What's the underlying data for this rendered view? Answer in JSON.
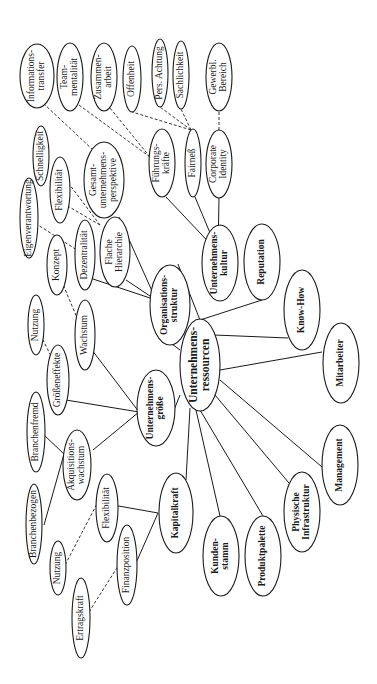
{
  "diagram": {
    "orientation": "rotated-90-ccw",
    "root": "Unternehmensressourcen",
    "nodes": [
      {
        "id": "ressourcen",
        "lines": [
          "Unternehmens-",
          "ressourcen"
        ],
        "x": 200,
        "y": 365,
        "rx": 20,
        "ry": 46,
        "style": "core"
      },
      {
        "id": "orgstruktur",
        "lines": [
          "Organisations-",
          "struktur"
        ],
        "x": 170,
        "y": 305,
        "rx": 20,
        "ry": 40,
        "style": "bold"
      },
      {
        "id": "groesse",
        "lines": [
          "Unternehmens-",
          "größe"
        ],
        "x": 156,
        "y": 408,
        "rx": 19,
        "ry": 38,
        "style": "bold"
      },
      {
        "id": "kapitalkraft",
        "lines": [
          "Kapitalkraft"
        ],
        "x": 176,
        "y": 513,
        "rx": 17,
        "ry": 40,
        "style": "bold"
      },
      {
        "id": "kultur",
        "lines": [
          "Unternehmens-",
          "kultur"
        ],
        "x": 220,
        "y": 263,
        "rx": 18,
        "ry": 38,
        "style": "bold"
      },
      {
        "id": "reputation",
        "lines": [
          "Reputation"
        ],
        "x": 262,
        "y": 262,
        "rx": 18,
        "ry": 38,
        "style": "bold"
      },
      {
        "id": "knowhow",
        "lines": [
          "Know-How"
        ],
        "x": 302,
        "y": 310,
        "rx": 18,
        "ry": 40,
        "style": "bold"
      },
      {
        "id": "mitarbeiter",
        "lines": [
          "Mitarbeiter"
        ],
        "x": 341,
        "y": 363,
        "rx": 18,
        "ry": 40,
        "style": "bold"
      },
      {
        "id": "management",
        "lines": [
          "Management"
        ],
        "x": 340,
        "y": 465,
        "rx": 18,
        "ry": 40,
        "style": "bold"
      },
      {
        "id": "infrastruktur",
        "lines": [
          "Physische",
          "Infrastruktur"
        ],
        "x": 302,
        "y": 512,
        "rx": 18,
        "ry": 40,
        "style": "bold"
      },
      {
        "id": "produktpalette",
        "lines": [
          "Produktpalette"
        ],
        "x": 263,
        "y": 556,
        "rx": 18,
        "ry": 40,
        "style": "bold"
      },
      {
        "id": "kundenstamm",
        "lines": [
          "Kunden-",
          "stamm"
        ],
        "x": 221,
        "y": 556,
        "rx": 18,
        "ry": 40,
        "style": "bold"
      },
      {
        "id": "fuehrungskraefte",
        "lines": [
          "Führungs-",
          "kräfte"
        ],
        "x": 162,
        "y": 163,
        "rx": 13,
        "ry": 34,
        "style": "normal"
      },
      {
        "id": "fairness",
        "lines": [
          "Fairneß"
        ],
        "x": 193,
        "y": 163,
        "rx": 8,
        "ry": 34,
        "style": "normal"
      },
      {
        "id": "corporate",
        "lines": [
          "Corporate",
          "Identity"
        ],
        "x": 219,
        "y": 164,
        "rx": 13,
        "ry": 34,
        "style": "normal"
      },
      {
        "id": "gewerbl",
        "lines": [
          "Gewerbl.",
          "Bereich"
        ],
        "x": 219,
        "y": 77,
        "rx": 13,
        "ry": 34,
        "style": "normal"
      },
      {
        "id": "informationstransfer",
        "lines": [
          "Informations-",
          "transfer"
        ],
        "x": 37,
        "y": 76,
        "rx": 17,
        "ry": 32,
        "style": "normal"
      },
      {
        "id": "teammentalitaet",
        "lines": [
          "Team-",
          "mentalität"
        ],
        "x": 70,
        "y": 77,
        "rx": 13,
        "ry": 34,
        "style": "normal"
      },
      {
        "id": "zusammenarbeit",
        "lines": [
          "Zusammen-",
          "arbeit"
        ],
        "x": 104,
        "y": 77,
        "rx": 13,
        "ry": 34,
        "style": "normal"
      },
      {
        "id": "offenheit",
        "lines": [
          "Offenheit"
        ],
        "x": 132,
        "y": 79,
        "rx": 9,
        "ry": 33,
        "style": "normal"
      },
      {
        "id": "persachtung",
        "lines": [
          "Pers. Achtung"
        ],
        "x": 160,
        "y": 73,
        "rx": 8,
        "ry": 34,
        "style": "normal"
      },
      {
        "id": "sachlichkeit",
        "lines": [
          "Sachlichkeit"
        ],
        "x": 181,
        "y": 75,
        "rx": 8,
        "ry": 34,
        "style": "normal"
      },
      {
        "id": "gesamtunternehmen",
        "lines": [
          "Gesamt-",
          "unternehmens-",
          "perspektive"
        ],
        "x": 104,
        "y": 180,
        "rx": 20,
        "ry": 38,
        "style": "normal"
      },
      {
        "id": "schnelligkeit",
        "lines": [
          "Schnelligkeit"
        ],
        "x": 41,
        "y": 156,
        "rx": 8,
        "ry": 30,
        "style": "normal"
      },
      {
        "id": "flexibilitaet_org",
        "lines": [
          "Flexibilität"
        ],
        "x": 60,
        "y": 190,
        "rx": 10,
        "ry": 33,
        "style": "normal"
      },
      {
        "id": "eigenverantwortung",
        "lines": [
          "Eigenverantwortung"
        ],
        "x": 29,
        "y": 218,
        "rx": 9,
        "ry": 40,
        "style": "normal"
      },
      {
        "id": "dezentralitaet",
        "lines": [
          "Dezentralität"
        ],
        "x": 85,
        "y": 255,
        "rx": 10,
        "ry": 35,
        "style": "normal"
      },
      {
        "id": "flachehierarchie",
        "lines": [
          "Flache",
          "Hierarchie"
        ],
        "x": 115,
        "y": 252,
        "rx": 15,
        "ry": 35,
        "style": "normal"
      },
      {
        "id": "konzept",
        "lines": [
          "Konzept"
        ],
        "x": 57,
        "y": 265,
        "rx": 10,
        "ry": 30,
        "style": "normal"
      },
      {
        "id": "nutzung_g",
        "lines": [
          "Nutzung"
        ],
        "x": 36,
        "y": 325,
        "rx": 8,
        "ry": 30,
        "style": "normal"
      },
      {
        "id": "wachstum",
        "lines": [
          "Wachstum"
        ],
        "x": 85,
        "y": 335,
        "rx": 10,
        "ry": 35,
        "style": "normal"
      },
      {
        "id": "groesseneffekte",
        "lines": [
          "Größeneffekte"
        ],
        "x": 58,
        "y": 380,
        "rx": 11,
        "ry": 35,
        "style": "normal"
      },
      {
        "id": "branchenfremd",
        "lines": [
          "Branchenfremd"
        ],
        "x": 36,
        "y": 432,
        "rx": 9,
        "ry": 40,
        "style": "normal"
      },
      {
        "id": "akquisition",
        "lines": [
          "Akquisitions-",
          "wachstum"
        ],
        "x": 77,
        "y": 465,
        "rx": 14,
        "ry": 35,
        "style": "normal"
      },
      {
        "id": "branchenbezogen",
        "lines": [
          "Branchenbezogen"
        ],
        "x": 34,
        "y": 524,
        "rx": 8,
        "ry": 40,
        "style": "normal"
      },
      {
        "id": "flexibilitaet_kap",
        "lines": [
          "Flexibilität"
        ],
        "x": 107,
        "y": 508,
        "rx": 11,
        "ry": 34,
        "style": "normal"
      },
      {
        "id": "nutzung_k",
        "lines": [
          "Nutzung"
        ],
        "x": 58,
        "y": 568,
        "rx": 8,
        "ry": 27,
        "style": "normal"
      },
      {
        "id": "finanzposition",
        "lines": [
          "Finanzposition"
        ],
        "x": 127,
        "y": 565,
        "rx": 10,
        "ry": 40,
        "style": "normal"
      },
      {
        "id": "ertragskraft",
        "lines": [
          "Ertragskraft"
        ],
        "x": 81,
        "y": 618,
        "rx": 9,
        "ry": 40,
        "style": "normal"
      }
    ],
    "edges": [
      {
        "from": [
          200,
          320
        ],
        "to": [
          178,
          264
        ],
        "type": "solid"
      },
      {
        "from": [
          200,
          320
        ],
        "to": [
          262,
          300
        ],
        "type": "solid"
      },
      {
        "from": [
          214,
          335
        ],
        "to": [
          288,
          338
        ],
        "type": "solid"
      },
      {
        "from": [
          220,
          370
        ],
        "to": [
          322,
          352
        ],
        "type": "solid"
      },
      {
        "from": [
          220,
          380
        ],
        "to": [
          322,
          467
        ],
        "type": "solid"
      },
      {
        "from": [
          215,
          395
        ],
        "to": [
          289,
          483
        ],
        "type": "solid"
      },
      {
        "from": [
          200,
          410
        ],
        "to": [
          263,
          516
        ],
        "type": "solid"
      },
      {
        "from": [
          196,
          410
        ],
        "to": [
          220,
          516
        ],
        "type": "solid"
      },
      {
        "from": [
          185,
          335
        ],
        "to": [
          188,
          330
        ],
        "type": "solid"
      },
      {
        "from": [
          180,
          350
        ],
        "to": [
          160,
          335
        ],
        "type": "solid"
      },
      {
        "from": [
          180,
          395
        ],
        "to": [
          174,
          410
        ],
        "type": "solid"
      },
      {
        "from": [
          190,
          408
        ],
        "to": [
          186,
          480
        ],
        "type": "solid"
      },
      {
        "from": [
          156,
          300
        ],
        "to": [
          119,
          217
        ],
        "type": "solid"
      },
      {
        "from": [
          156,
          300
        ],
        "to": [
          126,
          280
        ],
        "type": "solid"
      },
      {
        "from": [
          156,
          300
        ],
        "to": [
          90,
          278
        ],
        "type": "solid"
      },
      {
        "from": [
          139,
          412
        ],
        "to": [
          92,
          350
        ],
        "type": "solid"
      },
      {
        "from": [
          139,
          412
        ],
        "to": [
          66,
          400
        ],
        "type": "solid"
      },
      {
        "from": [
          139,
          412
        ],
        "to": [
          93,
          450
        ],
        "type": "solid"
      },
      {
        "from": [
          158,
          513
        ],
        "to": [
          113,
          505
        ],
        "type": "solid"
      },
      {
        "from": [
          158,
          513
        ],
        "to": [
          136,
          563
        ],
        "type": "solid"
      },
      {
        "from": [
          64,
          454
        ],
        "to": [
          44,
          435
        ],
        "type": "solid"
      },
      {
        "from": [
          64,
          454
        ],
        "to": [
          44,
          525
        ],
        "type": "solid"
      },
      {
        "from": [
          218,
          252
        ],
        "to": [
          166,
          197
        ],
        "type": "solid"
      },
      {
        "from": [
          218,
          252
        ],
        "to": [
          195,
          197
        ],
        "type": "solid"
      },
      {
        "from": [
          218,
          252
        ],
        "to": [
          219,
          198
        ],
        "type": "solid"
      },
      {
        "from": [
          219,
          130
        ],
        "to": [
          219,
          111
        ],
        "type": "dashed"
      },
      {
        "from": [
          191,
          130
        ],
        "to": [
          132,
          112
        ],
        "type": "dashed"
      },
      {
        "from": [
          191,
          130
        ],
        "to": [
          160,
          107
        ],
        "type": "dashed"
      },
      {
        "from": [
          191,
          130
        ],
        "to": [
          181,
          109
        ],
        "type": "dashed"
      },
      {
        "from": [
          150,
          157
        ],
        "to": [
          79,
          105
        ],
        "type": "dashed"
      },
      {
        "from": [
          150,
          157
        ],
        "to": [
          110,
          108
        ],
        "type": "dashed"
      },
      {
        "from": [
          100,
          225
        ],
        "to": [
          54,
          164
        ],
        "type": "dashed"
      },
      {
        "from": [
          100,
          225
        ],
        "to": [
          66,
          205
        ],
        "type": "dashed"
      },
      {
        "from": [
          93,
          150
        ],
        "to": [
          44,
          104
        ],
        "type": "dashed"
      },
      {
        "from": [
          80,
          252
        ],
        "to": [
          38,
          225
        ],
        "type": "dashed"
      },
      {
        "from": [
          80,
          325
        ],
        "to": [
          62,
          282
        ],
        "type": "dashed"
      },
      {
        "from": [
          53,
          360
        ],
        "to": [
          42,
          338
        ],
        "type": "dashed"
      },
      {
        "from": [
          99,
          500
        ],
        "to": [
          65,
          565
        ],
        "type": "dashed"
      },
      {
        "from": [
          120,
          563
        ],
        "to": [
          87,
          615
        ],
        "type": "dashed"
      }
    ]
  }
}
